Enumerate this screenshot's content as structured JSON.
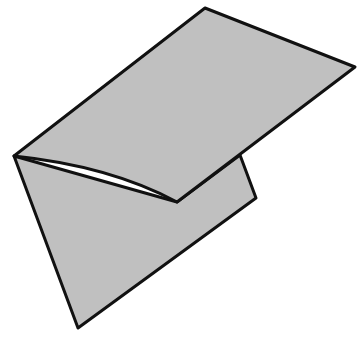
{
  "figure": {
    "fill_color": "#c0c0c0",
    "stroke_color": "#111111",
    "background": "#ffffff",
    "shapes": {
      "back_flap": [
        [
          14,
          156
        ],
        [
          78,
          328
        ],
        [
          256,
          198
        ],
        [
          240,
          155
        ],
        [
          177,
          202
        ]
      ],
      "top_flap": [
        [
          14,
          156
        ],
        [
          205,
          8
        ],
        [
          355,
          67
        ],
        [
          177,
          202
        ]
      ]
    }
  }
}
